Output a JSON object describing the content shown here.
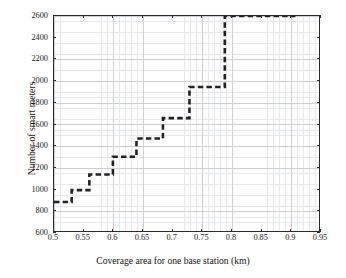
{
  "chart_data": {
    "type": "line",
    "subtype": "step-post",
    "title": "",
    "xlabel": "Coverage area for one base station (km)",
    "ylabel": "Number of smart meters",
    "xlim": [
      0.5,
      0.95
    ],
    "ylim": [
      600,
      2600
    ],
    "xticks": [
      0.5,
      0.55,
      0.6,
      0.65,
      0.7,
      0.75,
      0.8,
      0.85,
      0.9,
      0.95
    ],
    "xtick_labels": [
      "0.5",
      "0.55",
      "0.6",
      "0.65",
      "0.7",
      "0.75",
      "0.8",
      "0.85",
      "0.9",
      "0.95"
    ],
    "yticks": [
      600,
      800,
      1000,
      1200,
      1400,
      1600,
      1800,
      2000,
      2200,
      2400,
      2600
    ],
    "ytick_labels": [
      "600",
      "800",
      "1000",
      "1200",
      "1400",
      "1600",
      "1800",
      "2000",
      "2200",
      "2400",
      "2600"
    ],
    "grid": true,
    "minor_grid": true,
    "legend": false,
    "legend_position": "none",
    "line_style": "dashed",
    "line_color": "#222222",
    "line_width": 2.6,
    "annotations": [],
    "x": [
      0.5,
      0.53,
      0.56,
      0.6,
      0.64,
      0.685,
      0.73,
      0.79,
      0.91
    ],
    "y": [
      870,
      980,
      1125,
      1290,
      1460,
      1650,
      1940,
      2600,
      2600
    ],
    "series": [
      {
        "name": "Number of smart meters",
        "points": [
          {
            "x": 0.5,
            "y": 870
          },
          {
            "x": 0.53,
            "y": 980
          },
          {
            "x": 0.56,
            "y": 1125
          },
          {
            "x": 0.6,
            "y": 1290
          },
          {
            "x": 0.64,
            "y": 1460
          },
          {
            "x": 0.685,
            "y": 1650
          },
          {
            "x": 0.73,
            "y": 1940
          },
          {
            "x": 0.79,
            "y": 2600
          },
          {
            "x": 0.91,
            "y": 2600
          }
        ]
      }
    ]
  }
}
